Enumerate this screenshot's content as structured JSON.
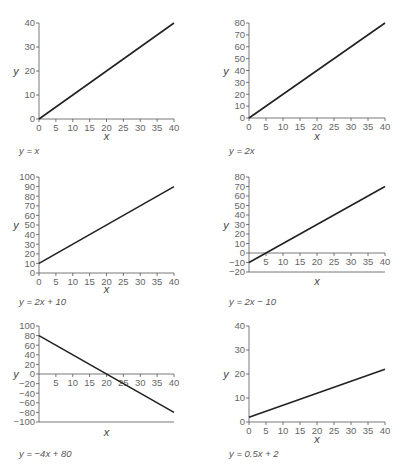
{
  "chart_data": [
    {
      "type": "line",
      "title": "y = x",
      "equation": "y = x",
      "xlabel": "x",
      "ylabel": "y",
      "x": [
        0,
        40
      ],
      "y": [
        0,
        40
      ],
      "xlim": [
        0,
        40
      ],
      "ylim": [
        0,
        40
      ],
      "xticks": [
        0,
        5,
        10,
        15,
        20,
        25,
        30,
        35,
        40
      ],
      "yticks": [
        0,
        10,
        20,
        30,
        40
      ],
      "grid": false
    },
    {
      "type": "line",
      "title": "y = 2x",
      "equation": "y = 2x",
      "xlabel": "x",
      "ylabel": "y",
      "x": [
        0,
        40
      ],
      "y": [
        0,
        80
      ],
      "xlim": [
        0,
        40
      ],
      "ylim": [
        0,
        80
      ],
      "xticks": [
        0,
        5,
        10,
        15,
        20,
        25,
        30,
        35,
        40
      ],
      "yticks": [
        0,
        10,
        20,
        30,
        40,
        50,
        60,
        70,
        80
      ],
      "grid": false
    },
    {
      "type": "line",
      "title": "y = 2x + 10",
      "equation": "y = 2x + 10",
      "xlabel": "x",
      "ylabel": "y",
      "x": [
        0,
        40
      ],
      "y": [
        10,
        90
      ],
      "xlim": [
        0,
        40
      ],
      "ylim": [
        0,
        100
      ],
      "xticks": [
        0,
        5,
        10,
        15,
        20,
        25,
        30,
        35,
        40
      ],
      "yticks": [
        0,
        10,
        20,
        30,
        40,
        50,
        60,
        70,
        80,
        90,
        100
      ],
      "grid": false
    },
    {
      "type": "line",
      "title": "y = 2x − 10",
      "equation": "y = 2x − 10",
      "xlabel": "x",
      "ylabel": "y",
      "x": [
        0,
        40
      ],
      "y": [
        -10,
        70
      ],
      "xlim": [
        0,
        40
      ],
      "ylim": [
        -20,
        80
      ],
      "xticks": [
        5,
        10,
        15,
        20,
        25,
        30,
        35,
        40
      ],
      "yticks": [
        -20,
        -10,
        0,
        10,
        20,
        30,
        40,
        50,
        60,
        70,
        80
      ],
      "grid": false
    },
    {
      "type": "line",
      "title": "y = −4x + 80",
      "equation": "y = −4x + 80",
      "xlabel": "x",
      "ylabel": "y",
      "x": [
        0,
        40
      ],
      "y": [
        80,
        -80
      ],
      "xlim": [
        0,
        40
      ],
      "ylim": [
        -100,
        100
      ],
      "xticks": [
        5,
        10,
        15,
        20,
        25,
        30,
        35,
        40
      ],
      "yticks": [
        -100,
        -80,
        -60,
        -40,
        -20,
        0,
        20,
        40,
        60,
        80,
        100
      ],
      "grid": false
    },
    {
      "type": "line",
      "title": "y = 0.5x + 2",
      "equation": "y = 0.5x + 2",
      "xlabel": "x",
      "ylabel": "y",
      "x": [
        0,
        40
      ],
      "y": [
        2,
        22
      ],
      "xlim": [
        0,
        40
      ],
      "ylim": [
        0,
        40
      ],
      "xticks": [
        0,
        5,
        10,
        15,
        20,
        25,
        30,
        35,
        40
      ],
      "yticks": [
        0,
        10,
        20,
        30,
        40
      ],
      "grid": false
    }
  ],
  "labels": {
    "eq1": "y = x",
    "eq2": "y = 2x",
    "eq3": "y = 2x + 10",
    "eq4": "y = 2x − 10",
    "eq5": "y = −4x + 80",
    "eq6": "y = 0.5x + 2",
    "x": "x",
    "y": "y"
  }
}
